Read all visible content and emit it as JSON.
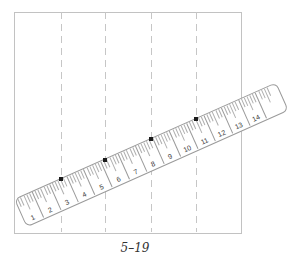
{
  "figure": {
    "caption": "5–19",
    "paper": {
      "left": 14,
      "top": 12,
      "width": 226,
      "height": 220
    },
    "guides": {
      "xs": [
        60.5,
        105,
        150.5,
        195.5
      ],
      "top": 12,
      "bottom": 232
    },
    "ruler": {
      "left": 14,
      "top": 199,
      "length": 285,
      "width": 29,
      "angle_deg": -24,
      "unit_pitch": 18.8,
      "first_unit_line": 18,
      "subticks_per_unit": 6,
      "numbers": [
        "1",
        "2",
        "3",
        "4",
        "5",
        "6",
        "7",
        "8",
        "9",
        "10",
        "11",
        "12",
        "13",
        "14"
      ]
    },
    "dots": {
      "points": [
        [
          60.5,
          179
        ],
        [
          105,
          159.5
        ],
        [
          150.5,
          139
        ],
        [
          195.5,
          119.3
        ]
      ],
      "size": 4
    },
    "colors": {
      "background": "#ffffff",
      "paper_border": "#c2c2c2",
      "guide_dash": "#c6c6c6",
      "ruler_border": "#9a9a9a",
      "tick": "#aeaeae",
      "unit_line": "#9a9a9a",
      "number": "#3a3a3a",
      "dot": "#1c1c1c",
      "caption": "#333333"
    }
  }
}
